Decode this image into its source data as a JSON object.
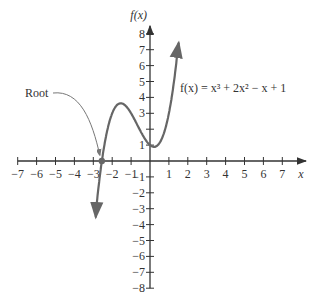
{
  "chart_data": {
    "type": "line",
    "title": "",
    "function_label": "f(x) = x³ + 2x² − x + 1",
    "xlabel": "x",
    "ylabel": "f(x)",
    "xlim": [
      -7,
      7
    ],
    "ylim": [
      -8,
      8
    ],
    "x_ticks": [
      -7,
      -6,
      -5,
      -4,
      -3,
      -2,
      -1,
      1,
      2,
      3,
      4,
      5,
      6,
      7
    ],
    "y_ticks": [
      -8,
      -7,
      -6,
      -5,
      -4,
      -3,
      -2,
      -1,
      1,
      3,
      4,
      5,
      6,
      7,
      8
    ],
    "y_unlabeled_ticks": [
      2
    ],
    "grid": false,
    "annotation": {
      "text": "Root",
      "x": -2.55,
      "y": 0
    },
    "series": [
      {
        "name": "f(x)",
        "expression": "x^3 + 2x^2 - x + 1",
        "color": "#666666"
      }
    ],
    "local_max": {
      "x": -1.55,
      "y": 3.63
    },
    "local_min": {
      "x": 0.22,
      "y": 0.88
    }
  },
  "labels": {
    "xlabel": "x",
    "ylabel": "f(x)",
    "function": "f(x) = x³ + 2x² − x + 1",
    "root": "Root"
  }
}
